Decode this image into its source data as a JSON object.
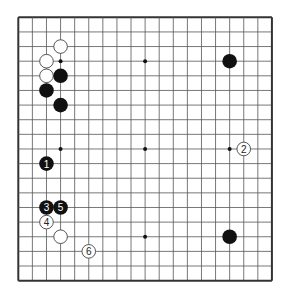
{
  "board": {
    "size": 19,
    "left": 18.3,
    "top": 17.3,
    "col_spacing": 14.09,
    "row_spacing": 14.63,
    "line_color": "#555555",
    "border_color": "#333333",
    "star_points": [
      [
        4,
        4
      ],
      [
        10,
        4
      ],
      [
        16,
        4
      ],
      [
        4,
        10
      ],
      [
        10,
        10
      ],
      [
        16,
        10
      ],
      [
        4,
        16
      ],
      [
        10,
        16
      ],
      [
        16,
        16
      ]
    ]
  },
  "stones": [
    {
      "color": "white",
      "col": 4,
      "row": 3,
      "label": ""
    },
    {
      "color": "white",
      "col": 3,
      "row": 4,
      "label": ""
    },
    {
      "color": "white",
      "col": 3,
      "row": 5,
      "label": ""
    },
    {
      "color": "black",
      "col": 4,
      "row": 5,
      "label": ""
    },
    {
      "color": "black",
      "col": 3,
      "row": 6,
      "label": ""
    },
    {
      "color": "black",
      "col": 4,
      "row": 7,
      "label": ""
    },
    {
      "color": "black",
      "col": 16,
      "row": 4,
      "label": ""
    },
    {
      "color": "black",
      "col": 16,
      "row": 16,
      "label": ""
    },
    {
      "color": "white",
      "col": 4,
      "row": 16,
      "label": ""
    },
    {
      "color": "black",
      "col": 3,
      "row": 11,
      "label": "1"
    },
    {
      "color": "white",
      "col": 17,
      "row": 10,
      "label": "2"
    },
    {
      "color": "black",
      "col": 3,
      "row": 14,
      "label": "3"
    },
    {
      "color": "white",
      "col": 3,
      "row": 15,
      "label": "4"
    },
    {
      "color": "black",
      "col": 4,
      "row": 14,
      "label": "5"
    },
    {
      "color": "white",
      "col": 6,
      "row": 17,
      "label": "6"
    }
  ]
}
